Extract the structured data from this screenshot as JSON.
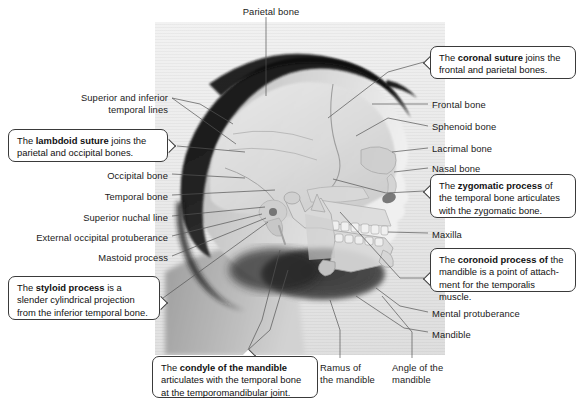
{
  "figure": {
    "image_region": {
      "x": 155,
      "y": 22,
      "width": 290,
      "height": 333
    },
    "photo_description": "Grayscale profile photograph of a human head facing right with a skull radiograph-style overlay"
  },
  "labels": [
    {
      "id": "parietal-bone",
      "text": "Parietal bone",
      "align": "center",
      "x": 226,
      "y": 6,
      "w": 90
    },
    {
      "id": "superior-inferior-temporal-lines",
      "text": "Superior and inferior\ntemporal lines",
      "align": "right",
      "x": 58,
      "y": 92,
      "w": 110
    },
    {
      "id": "occipital-bone",
      "text": "Occipital bone",
      "align": "right",
      "x": 62,
      "y": 170,
      "w": 106
    },
    {
      "id": "temporal-bone",
      "text": "Temporal bone",
      "align": "right",
      "x": 62,
      "y": 191,
      "w": 106
    },
    {
      "id": "superior-nuchal-line",
      "text": "Superior nuchal line",
      "align": "right",
      "x": 38,
      "y": 212,
      "w": 130
    },
    {
      "id": "external-occipital-protuberance",
      "text": "External occipital protuberance",
      "align": "right",
      "x": 5,
      "y": 232,
      "w": 163
    },
    {
      "id": "mastoid-process",
      "text": "Mastoid process",
      "align": "right",
      "x": 52,
      "y": 252,
      "w": 116
    },
    {
      "id": "frontal-bone",
      "text": "Frontal bone",
      "align": "left",
      "x": 432,
      "y": 99,
      "w": 100
    },
    {
      "id": "sphenoid-bone",
      "text": "Sphenoid bone",
      "align": "left",
      "x": 432,
      "y": 121,
      "w": 100
    },
    {
      "id": "lacrimal-bone",
      "text": "Lacrimal bone",
      "align": "left",
      "x": 432,
      "y": 143,
      "w": 100
    },
    {
      "id": "nasal-bone",
      "text": "Nasal bone",
      "align": "left",
      "x": 432,
      "y": 163,
      "w": 100
    },
    {
      "id": "maxilla",
      "text": "Maxilla",
      "align": "left",
      "x": 432,
      "y": 229,
      "w": 100
    },
    {
      "id": "mental-protuberance",
      "text": "Mental protuberance",
      "align": "left",
      "x": 432,
      "y": 308,
      "w": 120
    },
    {
      "id": "mandible",
      "text": "Mandible",
      "align": "left",
      "x": 432,
      "y": 329,
      "w": 100
    },
    {
      "id": "ramus-of-the-mandible",
      "text": "Ramus of\nthe mandible",
      "align": "left",
      "x": 320,
      "y": 362,
      "w": 70
    },
    {
      "id": "angle-of-the-mandible",
      "text": "Angle of the\nmandible",
      "align": "left",
      "x": 392,
      "y": 362,
      "w": 74
    }
  ],
  "callouts": [
    {
      "id": "coronal-suture",
      "x": 430,
      "y": 46,
      "w": 146,
      "h": 33,
      "tab": "left",
      "tab_y": 16,
      "parts": [
        {
          "text": "The ",
          "bold": false
        },
        {
          "text": "coronal suture",
          "bold": true
        },
        {
          "text": " joins the frontal and parietal bones.",
          "bold": false
        }
      ]
    },
    {
      "id": "lambdoid-suture",
      "x": 8,
      "y": 129,
      "w": 160,
      "h": 33,
      "tab": "right",
      "tab_y": 16,
      "parts": [
        {
          "text": "The ",
          "bold": false
        },
        {
          "text": "lambdoid suture",
          "bold": true
        },
        {
          "text": " joins the parietal and occipital bones.",
          "bold": false
        }
      ]
    },
    {
      "id": "zygomatic-process",
      "x": 430,
      "y": 174,
      "w": 146,
      "h": 44,
      "tab": "left",
      "tab_y": 17,
      "parts": [
        {
          "text": "The ",
          "bold": false
        },
        {
          "text": "zygomatic process",
          "bold": true
        },
        {
          "text": " of the temporal bone articulates with the zygomatic bone.",
          "bold": false
        }
      ]
    },
    {
      "id": "coronoid-process",
      "x": 430,
      "y": 248,
      "w": 146,
      "h": 44,
      "tab": "left",
      "tab_y": 30,
      "parts": [
        {
          "text": "The ",
          "bold": false
        },
        {
          "text": "coronoid process of",
          "bold": true
        },
        {
          "text": " the mandible is a point of attach-ment for the temporalis muscle.",
          "bold": false
        }
      ]
    },
    {
      "id": "styloid-process",
      "x": 8,
      "y": 276,
      "w": 152,
      "h": 44,
      "tab": "right",
      "tab_y": 26,
      "parts": [
        {
          "text": "The ",
          "bold": false
        },
        {
          "text": "styloid process",
          "bold": true
        },
        {
          "text": " is a slender cylindrical projection from the inferior temporal bone.",
          "bold": false
        }
      ]
    },
    {
      "id": "condyle-of-the-mandible",
      "x": 152,
      "y": 356,
      "w": 166,
      "h": 42,
      "tab": "top",
      "tab_x": 96,
      "parts": [
        {
          "text": "The ",
          "bold": false
        },
        {
          "text": "condyle of the mandible",
          "bold": true
        },
        {
          "text": " articulates with the temporal bone at the temporomandibular joint.",
          "bold": false
        }
      ]
    }
  ],
  "leader_lines": [
    {
      "id": "leader-parietal-bone",
      "points": "266,17 266,96"
    },
    {
      "id": "leader-temporal-lines-1",
      "points": "172,98 200,104 233,124"
    },
    {
      "id": "leader-temporal-lines-2",
      "points": "172,98 236,144"
    },
    {
      "id": "leader-lambdoid-suture",
      "points": "177,146 245,152"
    },
    {
      "id": "leader-occipital-bone",
      "points": "172,174 245,178"
    },
    {
      "id": "leader-temporal-bone",
      "points": "172,195 275,190"
    },
    {
      "id": "leader-superior-nuchal-line",
      "points": "172,216 265,207"
    },
    {
      "id": "leader-external-occipital-protuberance",
      "points": "172,236 262,214"
    },
    {
      "id": "leader-mastoid-process",
      "points": "172,256 266,218"
    },
    {
      "id": "leader-styloid-process",
      "points": "163,298 268,222"
    },
    {
      "id": "leader-coronal-suture",
      "points": "424,62 388,72 328,118"
    },
    {
      "id": "leader-frontal-bone",
      "points": "428,104 372,104"
    },
    {
      "id": "leader-sphenoid-bone",
      "points": "428,126 388,118 356,136"
    },
    {
      "id": "leader-lacrimal-bone",
      "points": "428,148 392,152"
    },
    {
      "id": "leader-nasal-bone",
      "points": "428,168 394,172"
    },
    {
      "id": "leader-zygomatic-process",
      "points": "424,191 386,193 333,179"
    },
    {
      "id": "leader-maxilla",
      "points": "428,233 388,232"
    },
    {
      "id": "leader-coronoid-process",
      "points": "424,278 400,278 340,212"
    },
    {
      "id": "leader-mental-protuberance",
      "points": "428,312 400,306 376,288"
    },
    {
      "id": "leader-mandible",
      "points": "428,332 404,328 356,296"
    },
    {
      "id": "leader-condyle-of-the-mandible-1",
      "points": "248,350 270,330 288,270"
    },
    {
      "id": "leader-condyle-of-the-mandible-2",
      "points": "248,350 262,320 280,250"
    },
    {
      "id": "leader-ramus-of-the-mandible",
      "points": "340,358 340,330 330,300"
    },
    {
      "id": "leader-angle-of-the-mandible",
      "points": "412,358 412,332 382,296"
    }
  ]
}
